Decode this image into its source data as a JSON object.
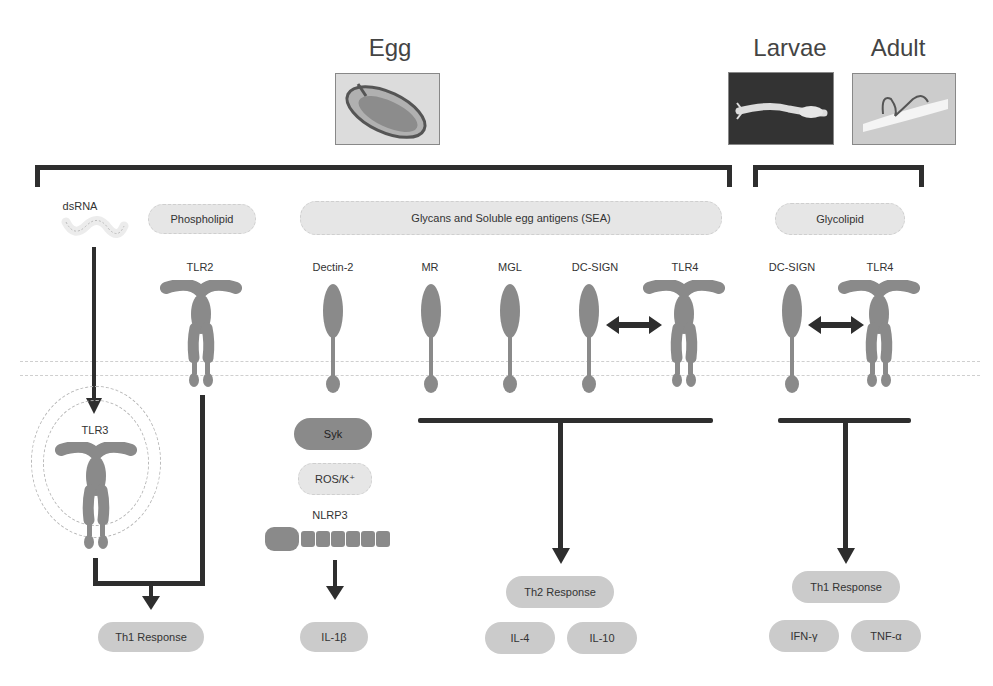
{
  "stages": {
    "egg": {
      "label": "Egg"
    },
    "larvae": {
      "label": "Larvae"
    },
    "adult": {
      "label": "Adult"
    }
  },
  "ligands": {
    "dsrna": "dsRNA",
    "phospholipid": "Phospholipid",
    "glycans": "Glycans and Soluble egg antigens (SEA)",
    "glycolipid": "Glycolipid"
  },
  "receptors": {
    "tlr2": "TLR2",
    "tlr3": "TLR3",
    "dectin2": "Dectin-2",
    "mr": "MR",
    "mgl": "MGL",
    "dcsign_egg": "DC-SIGN",
    "tlr4_egg": "TLR4",
    "dcsign_adult": "DC-SIGN",
    "tlr4_adult": "TLR4"
  },
  "signaling": {
    "syk": "Syk",
    "ros": "ROS/K⁺",
    "nlrp3": "NLRP3"
  },
  "outcomes": {
    "th1_left": "Th1 Response",
    "il1b": "IL-1β",
    "th2": "Th2 Response",
    "il4": "IL-4",
    "il10": "IL-10",
    "th1_right": "Th1 Response",
    "ifng": "IFN-γ",
    "tnfa": "TNF-α"
  },
  "colors": {
    "receptor": "#8a8a8a",
    "arrow": "#2e2e2e",
    "pill_light": "#e6e6e6",
    "pill_mid": "#cbcbcb",
    "membrane": "#cfcfcf"
  }
}
